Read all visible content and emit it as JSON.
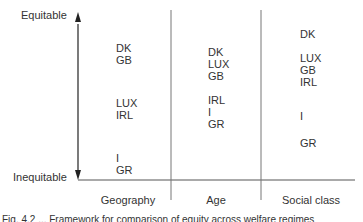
{
  "axis": {
    "top_label": "Equitable",
    "bottom_label": "Inequitable"
  },
  "columns": [
    {
      "label": "Geography",
      "groups": [
        [
          "DK",
          "GB"
        ],
        [
          "LUX",
          "IRL"
        ],
        [
          "I",
          "GR"
        ]
      ]
    },
    {
      "label": "Age",
      "groups": [
        [
          "DK",
          "LUX",
          "GB"
        ],
        [
          "IRL",
          "I",
          "GR"
        ]
      ]
    },
    {
      "label": "Social class",
      "groups": [
        [
          "DK"
        ],
        [
          "LUX",
          "GB",
          "IRL"
        ],
        [
          "I"
        ],
        [
          "GR"
        ]
      ]
    }
  ],
  "caption": "Fig. 4.2 ... Framework for comparison of equity across welfare regimes"
}
